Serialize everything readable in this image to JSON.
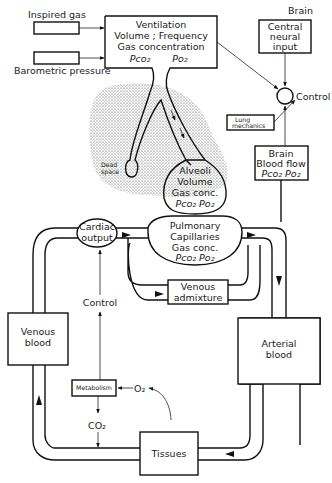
{
  "diagram": {
    "type": "physiological block diagram",
    "inputs": {
      "inspired_gas": "Inspired gas",
      "barometric_pressure": "Barometric pressure"
    },
    "ventilation": {
      "line1": "Ventilation",
      "line2": "Volume ; Frequency",
      "line3": "Gas concentration",
      "pco2": "Pco₂",
      "po2": "Po₂"
    },
    "brain": {
      "title": "Brain",
      "central_input_line1": "Central",
      "central_input_line2": "neural",
      "central_input_line3": "input",
      "control": "Control"
    },
    "lung": {
      "dead_space_line1": "Dead",
      "dead_space_line2": "space",
      "mechanics_line1": "Lung",
      "mechanics_line2": "mechanics"
    },
    "alveoli": {
      "line1": "Alveoli",
      "line2": "Volume",
      "line3": "Gas conc.",
      "gases": "Pco₂  Po₂"
    },
    "brain_blood_flow": {
      "line1": "Brain",
      "line2": "Blood flow",
      "gases": "Pco₂   Po₂"
    },
    "cardiac_output": {
      "line1": "Cardiac",
      "line2": "output"
    },
    "pulmonary": {
      "line1": "Pulmonary",
      "line2": "Capillaries",
      "line3": "Gas conc.",
      "gases": "Pco₂ Po₂"
    },
    "venous_admixture": {
      "line1": "Venous",
      "line2": "admixture"
    },
    "circulation": {
      "control": "Control",
      "venous_blood_line1": "Venous",
      "venous_blood_line2": "blood",
      "arterial_blood_line1": "Arterial",
      "arterial_blood_line2": "blood",
      "metabolism": "Metabolism",
      "o2": "O₂",
      "co2": "CO₂",
      "tissues": "Tissues"
    }
  }
}
